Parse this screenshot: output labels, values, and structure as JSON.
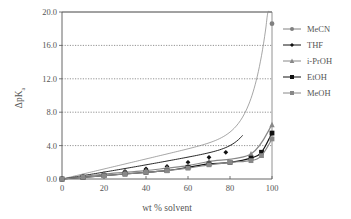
{
  "chart_data": {
    "type": "line",
    "title": "",
    "xlabel": "wt % solvent",
    "ylabel": "ΔpK",
    "ylabel_subscript": "a",
    "xlim": [
      0,
      100
    ],
    "ylim": [
      0,
      20
    ],
    "x_ticks": [
      0,
      20,
      40,
      60,
      80,
      100
    ],
    "x_tick_labels": [
      "0",
      "20",
      "40",
      "60",
      "80",
      "100"
    ],
    "y_ticks": [
      0,
      4,
      8,
      12,
      16,
      20
    ],
    "y_tick_labels": [
      "0.0",
      "4.0",
      "8.0",
      "12.0",
      "16.0",
      "20.0"
    ],
    "grid": "horizontal dotted",
    "legend_position": "right",
    "series": [
      {
        "name": "MeCN",
        "marker": "circle",
        "color": "#808080",
        "x": [
          0,
          10,
          20,
          30,
          40,
          100
        ],
        "values": [
          0.0,
          0.3,
          0.5,
          0.8,
          1.1,
          18.6
        ]
      },
      {
        "name": "THF",
        "marker": "diamond",
        "color": "#111111",
        "x": [
          0,
          10,
          20,
          30,
          40,
          50,
          60,
          70,
          78
        ],
        "values": [
          0.0,
          0.3,
          0.6,
          0.9,
          1.2,
          1.5,
          2.0,
          2.6,
          3.2
        ]
      },
      {
        "name": "i-PrOH",
        "marker": "triangle",
        "color": "#888888",
        "x": [
          0,
          10,
          20,
          30,
          40,
          50,
          60,
          70,
          90,
          100
        ],
        "values": [
          0.0,
          0.3,
          0.6,
          0.8,
          1.0,
          1.3,
          1.6,
          2.1,
          3.0,
          6.5
        ]
      },
      {
        "name": "EtOH",
        "marker": "square",
        "color": "#111111",
        "x": [
          0,
          10,
          20,
          30,
          40,
          50,
          60,
          70,
          80,
          90,
          95,
          100
        ],
        "values": [
          0.0,
          0.2,
          0.4,
          0.6,
          0.8,
          1.0,
          1.4,
          1.8,
          2.0,
          2.5,
          3.2,
          5.5
        ]
      },
      {
        "name": "MeOH",
        "marker": "square",
        "color": "#888888",
        "x": [
          0,
          10,
          20,
          30,
          40,
          50,
          60,
          70,
          80,
          90,
          95,
          100
        ],
        "values": [
          0.0,
          0.2,
          0.4,
          0.6,
          0.8,
          1.0,
          1.3,
          1.7,
          2.0,
          2.2,
          2.8,
          4.8
        ]
      }
    ]
  },
  "legend": {
    "items": [
      {
        "label": "MeCN"
      },
      {
        "label": "THF"
      },
      {
        "label": "i-PrOH"
      },
      {
        "label": "EtOH"
      },
      {
        "label": "MeOH"
      }
    ]
  }
}
